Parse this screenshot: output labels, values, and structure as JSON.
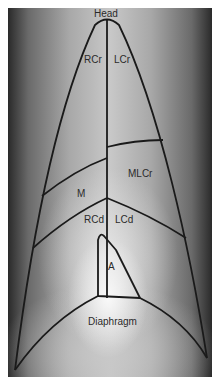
{
  "figure": {
    "type": "radiograph-lung-lobe-diagram",
    "labels": {
      "head": "Head",
      "right_cranial": "RCr",
      "left_cranial": "LCr",
      "middle": "M",
      "middle_left_cranial": "MLCr",
      "right_caudal": "RCd",
      "left_caudal": "LCd",
      "accessory": "A",
      "diaphragm": "Diaphragm"
    },
    "colors": {
      "line": "#1a1a1a",
      "label": "#2a2a2a",
      "border": "#ffffff"
    }
  }
}
